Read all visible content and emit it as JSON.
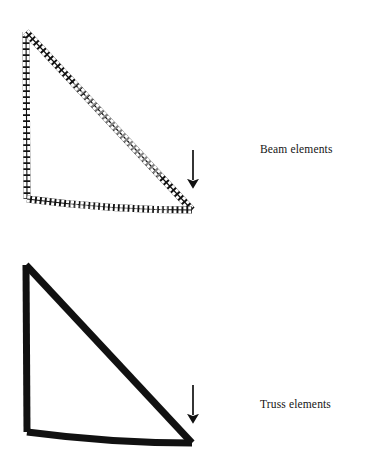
{
  "figure": {
    "title_visible": false,
    "background_color": "#ffffff",
    "ink_color": "#111111",
    "width": 368,
    "height": 474
  },
  "panels": [
    {
      "id": "beam",
      "label": "Beam elements",
      "label_position": {
        "x": 260,
        "y": 144
      },
      "element_type": "beam",
      "discretized": true,
      "element_ticks_visible": true,
      "member_thickness": 6.5,
      "nodes": {
        "apex": {
          "x": 26,
          "y": 32
        },
        "base_left": {
          "x": 27,
          "y": 199
        },
        "base_right": {
          "x": 192,
          "y": 210
        }
      },
      "members": [
        {
          "name": "vertical-column",
          "from": "apex",
          "to": "base_left",
          "elements": 28,
          "tick_orientation": "horizontal"
        },
        {
          "name": "diagonal-rafter",
          "from": "apex",
          "to": "base_right",
          "elements": 46,
          "tick_orientation": "perpendicular"
        },
        {
          "name": "bottom-chord",
          "from": "base_left",
          "to": "base_right",
          "elements": 44,
          "tick_orientation": "vertical",
          "deformed": true,
          "sag": 3
        }
      ],
      "load": {
        "name": "point-load",
        "direction": "down",
        "tail": {
          "x": 193,
          "y": 150
        },
        "head": {
          "x": 193,
          "y": 192
        },
        "shaft_width": 1.6,
        "head_width": 9,
        "head_length": 13
      }
    },
    {
      "id": "truss",
      "label": "Truss elements",
      "label_position": {
        "x": 260,
        "y": 399
      },
      "element_type": "truss",
      "discretized": false,
      "element_ticks_visible": false,
      "member_thickness": 6.5,
      "nodes": {
        "apex": {
          "x": 26,
          "y": 265
        },
        "base_left": {
          "x": 27,
          "y": 432
        },
        "base_right": {
          "x": 192,
          "y": 443
        }
      },
      "members": [
        {
          "name": "vertical-column",
          "from": "apex",
          "to": "base_left",
          "elements": 1
        },
        {
          "name": "diagonal-rafter",
          "from": "apex",
          "to": "base_right",
          "elements": 1
        },
        {
          "name": "bottom-chord",
          "from": "base_left",
          "to": "base_right",
          "elements": 1
        }
      ],
      "load": {
        "name": "point-load",
        "direction": "down",
        "tail": {
          "x": 193,
          "y": 385
        },
        "head": {
          "x": 193,
          "y": 427
        },
        "shaft_width": 1.6,
        "head_width": 9,
        "head_length": 13
      }
    }
  ]
}
